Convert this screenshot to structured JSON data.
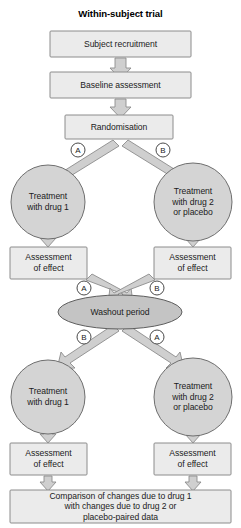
{
  "figure": {
    "title": "Within-subject trial",
    "type": "flowchart",
    "orientation": "top-to-bottom"
  },
  "colors": {
    "box_fill": "#ebebeb",
    "box_stroke": "#8c8c8c",
    "circle_fill": "#d4d4d4",
    "circle_stroke": "#6e6e6e",
    "ellipse_fill": "#c4c4c4",
    "ellipse_stroke": "#5e5e5e",
    "arrow_fill": "#cfcfcf",
    "arrow_stroke": "#8c8c8c",
    "badge_fill": "#ffffff",
    "badge_stroke": "#4a4a4a",
    "text": "#1b1b1b",
    "background": "#ffffff"
  },
  "nodes": {
    "subject_recruitment": {
      "label": "Subject recruitment",
      "shape": "rect"
    },
    "baseline_assessment": {
      "label": "Baseline assessment",
      "shape": "rect"
    },
    "randomisation": {
      "label": "Randomisation",
      "shape": "rect"
    },
    "treatment_drug1_period1": {
      "label": "Treatment\nwith drug 1",
      "shape": "circle"
    },
    "treatment_drug2_period1": {
      "label": "Treatment\nwith drug 2\nor placebo",
      "shape": "circle"
    },
    "assessment_left_period1": {
      "label": "Assessment\nof effect",
      "shape": "rect"
    },
    "assessment_right_period1": {
      "label": "Assessment\nof effect",
      "shape": "rect"
    },
    "washout_period": {
      "label": "Washout period",
      "shape": "ellipse"
    },
    "treatment_drug1_period2": {
      "label": "Treatment\nwith drug 1",
      "shape": "circle"
    },
    "treatment_drug2_period2": {
      "label": "Treatment\nwith drug 2\nor placebo",
      "shape": "circle"
    },
    "assessment_left_period2": {
      "label": "Assessment\nof effect",
      "shape": "rect"
    },
    "assessment_right_period2": {
      "label": "Assessment\nof effect",
      "shape": "rect"
    },
    "comparison": {
      "label": "Comparison of changes due to drug 1\nwith changes due to drug 2 or\nplacebo-paired data",
      "shape": "rect"
    }
  },
  "branch_labels": {
    "randomisation_left": "A",
    "randomisation_right": "B",
    "washout_in_left": "A",
    "washout_in_right": "B",
    "washout_out_left": "B",
    "washout_out_right": "A"
  }
}
